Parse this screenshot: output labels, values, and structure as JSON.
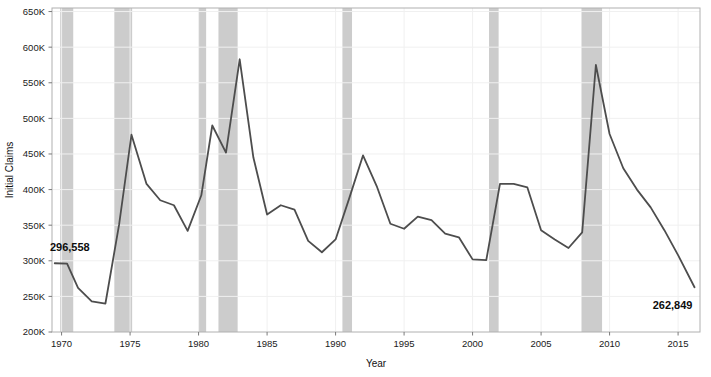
{
  "chart_data": {
    "type": "line",
    "title": "",
    "xlabel": "Year",
    "ylabel": "Initial Claims",
    "xlim": [
      1969.3,
      2016.6
    ],
    "ylim": [
      200000,
      655000
    ],
    "grid": true,
    "legend": "none",
    "y_tick_labels": [
      "200K",
      "250K",
      "300K",
      "350K",
      "400K",
      "450K",
      "500K",
      "550K",
      "600K",
      "650K"
    ],
    "y_tick_values": [
      200000,
      250000,
      300000,
      350000,
      400000,
      450000,
      500000,
      550000,
      600000,
      650000
    ],
    "x_tick_labels": [
      "1970",
      "1975",
      "1980",
      "1985",
      "1990",
      "1995",
      "2000",
      "2005",
      "2010",
      "2015"
    ],
    "x_tick_values": [
      1970,
      1975,
      1980,
      1985,
      1990,
      1995,
      2000,
      2005,
      2010,
      2015
    ],
    "series": [
      {
        "name": "Initial Claims",
        "color": "#4d4d4d",
        "x": [
          1969.5,
          1970.4,
          1971.2,
          1972.2,
          1973.2,
          1974.2,
          1975.1,
          1976.2,
          1977.2,
          1978.2,
          1979.2,
          1980.2,
          1981.0,
          1982.0,
          1983.0,
          1984.0,
          1985.0,
          1986.0,
          1987.0,
          1988.0,
          1989.0,
          1990.0,
          1991.0,
          1992.0,
          1993.0,
          1994.0,
          1995.0,
          1996.0,
          1997.0,
          1998.0,
          1999.0,
          2000.0,
          2001.0,
          2002.0,
          2003.0,
          2004.0,
          2005.0,
          2006.0,
          2007.0,
          2008.0,
          2009.0,
          2010.0,
          2011.0,
          2012.0,
          2013.0,
          2014.0,
          2015.0,
          2016.2
        ],
        "y": [
          296558,
          296000,
          262000,
          243000,
          240000,
          351000,
          477000,
          408000,
          385000,
          378000,
          342000,
          392000,
          490000,
          452000,
          583000,
          445000,
          365000,
          378000,
          372000,
          328000,
          312000,
          330000,
          388000,
          448000,
          405000,
          352000,
          345000,
          362000,
          357000,
          338000,
          333000,
          302000,
          301000,
          408000,
          408000,
          403000,
          343000,
          330000,
          318000,
          340000,
          575000,
          478000,
          430000,
          400000,
          375000,
          343000,
          308000,
          262849
        ]
      }
    ],
    "recession_bands": {
      "color": "#c9c9c9",
      "opacity": 0.95,
      "spans": [
        {
          "start": 1969.9,
          "end": 1970.85
        },
        {
          "start": 1973.85,
          "end": 1975.15
        },
        {
          "start": 1980.0,
          "end": 1980.55
        },
        {
          "start": 1981.45,
          "end": 1982.85
        },
        {
          "start": 1990.5,
          "end": 1991.2
        },
        {
          "start": 2001.2,
          "end": 2001.9
        },
        {
          "start": 2007.95,
          "end": 2009.45
        }
      ]
    },
    "annotations": [
      {
        "name": "start-value-label",
        "text": "296,558",
        "x": 1970.6,
        "y": 314000,
        "anchor": "middle"
      },
      {
        "name": "end-value-label",
        "text": "262,849",
        "x": 2014.6,
        "y": 232000,
        "anchor": "middle"
      }
    ]
  },
  "axes": {
    "y_title": "Initial Claims",
    "x_title": "Year"
  }
}
